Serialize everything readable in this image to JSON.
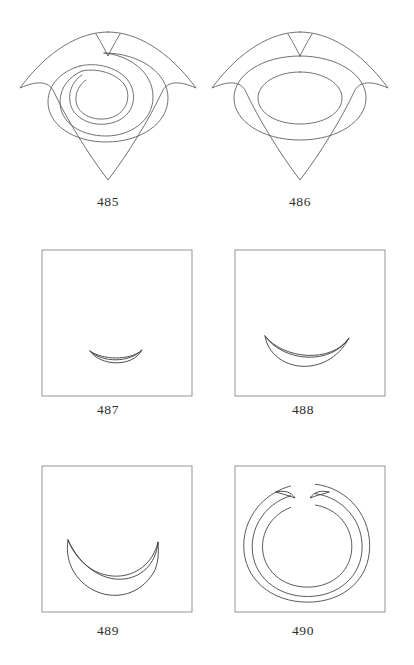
{
  "plate": {
    "title": "Geometric figures plate 485-490",
    "background_color": "#ffffff",
    "ink_color": "#595959",
    "frame_color": "#8a8a8a"
  },
  "figures": [
    {
      "number": "485",
      "label": "485",
      "kind": "cushion-with-spiral-lune",
      "framed": false,
      "description": "Concave-sided cushion (astroid-like) outline with a spiral crescent inside and a small cusp notch at top center"
    },
    {
      "number": "486",
      "label": "486",
      "kind": "cushion-with-concentric-ovals",
      "framed": false,
      "description": "Concave-sided cushion outline containing two concentric ovals and a small cusp notch at top center"
    },
    {
      "number": "487",
      "label": "487",
      "kind": "framed-lune-small",
      "framed": true,
      "description": "Square frame containing a small shallow crescent (lune) low and right of centre"
    },
    {
      "number": "488",
      "label": "488",
      "kind": "framed-lune-medium",
      "framed": true,
      "description": "Square frame containing a medium crescent (lune) slightly below centre"
    },
    {
      "number": "489",
      "label": "489",
      "kind": "framed-lune-large",
      "framed": true,
      "description": "Square frame containing a large deep crescent (lune) below centre"
    },
    {
      "number": "490",
      "label": "490",
      "kind": "framed-annular-crescent",
      "framed": true,
      "description": "Square frame containing a nearly closed annular crescent ring open at the top"
    }
  ]
}
